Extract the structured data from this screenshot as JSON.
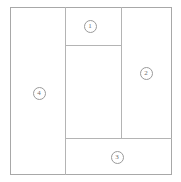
{
  "diagram": {
    "type": "region-partition-diagram",
    "canvas": {
      "width": 181,
      "height": 182,
      "background": "#ffffff"
    },
    "frame": {
      "x": 10,
      "y": 7,
      "width": 162,
      "height": 168,
      "stroke": "#a8a8a8"
    },
    "stroke_color": "#b4b4b4",
    "label_color": "#6e6e6e",
    "dividers": [
      {
        "name": "vertical-left",
        "orientation": "vertical",
        "x": 65,
        "y1": 7,
        "y2": 175
      },
      {
        "name": "vertical-right",
        "orientation": "vertical",
        "x": 121,
        "y1": 7,
        "y2": 138
      },
      {
        "name": "horizontal-top",
        "orientation": "horizontal",
        "y": 45,
        "x1": 65,
        "x2": 121
      },
      {
        "name": "horizontal-bottom",
        "orientation": "horizontal",
        "y": 138,
        "x1": 65,
        "x2": 172
      }
    ],
    "regions": [
      {
        "id": "1",
        "label": "1",
        "name": "region-1-top-center",
        "label_x": 90,
        "label_y": 26,
        "box": {
          "x": 65,
          "y": 7,
          "width": 56,
          "height": 38
        }
      },
      {
        "id": "2",
        "label": "2",
        "name": "region-2-right",
        "label_x": 146,
        "label_y": 73,
        "box": {
          "x": 121,
          "y": 7,
          "width": 51,
          "height": 131
        }
      },
      {
        "id": "3",
        "label": "3",
        "name": "region-3-bottom",
        "label_x": 117,
        "label_y": 157,
        "box": {
          "x": 65,
          "y": 138,
          "width": 107,
          "height": 37
        }
      },
      {
        "id": "4",
        "label": "4",
        "name": "region-4-left",
        "label_x": 39,
        "label_y": 93,
        "box": {
          "x": 10,
          "y": 7,
          "width": 55,
          "height": 168
        }
      },
      {
        "id": "center",
        "label": "",
        "name": "region-center-unlabeled",
        "label_x": null,
        "label_y": null,
        "box": {
          "x": 65,
          "y": 45,
          "width": 56,
          "height": 93
        }
      }
    ]
  }
}
